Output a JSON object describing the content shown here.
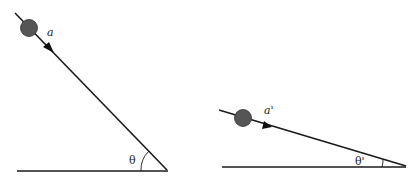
{
  "diagrams": [
    {
      "name": "steep-incline",
      "acceleration_label": "a",
      "angle_label": "θ"
    },
    {
      "name": "shallow-incline",
      "acceleration_label": "a'",
      "angle_label": "θ'"
    }
  ],
  "colors": {
    "line": "#1a1a1a",
    "ball": "#555555",
    "background": "#ffffff"
  }
}
